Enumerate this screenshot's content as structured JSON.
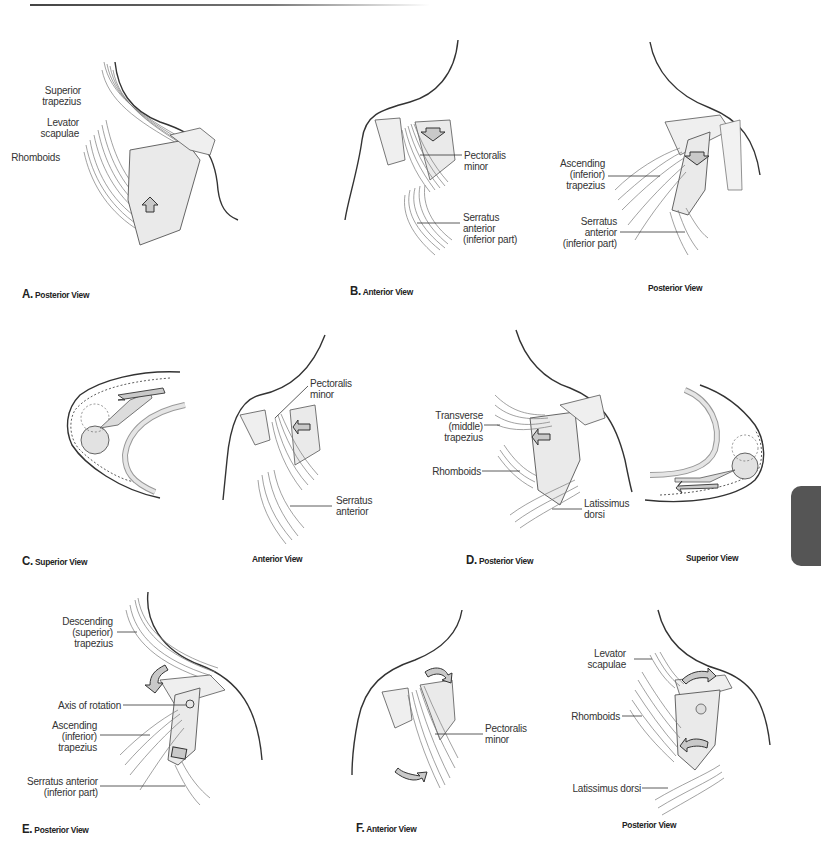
{
  "page": {
    "type": "anatomical-figure",
    "colors": {
      "line": "#333333",
      "muscle": "#8a8a8a",
      "bone_fill": "#e6e6e6",
      "arrow_fill": "#c9c9c9",
      "tab": "#555555"
    }
  },
  "panels": [
    {
      "id": "A",
      "caption_letter": "A.",
      "caption": "Posterior View",
      "labels": [
        "Superior trapezius",
        "Levator scapulae",
        "Rhomboids"
      ],
      "label_lines": {
        "superior_trapezius": [
          "Superior",
          "trapezius"
        ],
        "levator_scapulae": [
          "Levator",
          "scapulae"
        ],
        "rhomboids": [
          "Rhomboids"
        ]
      },
      "arrow": "up"
    },
    {
      "id": "B",
      "caption_letter": "B.",
      "caption": "Anterior View",
      "labels": [
        "Pectoralis minor",
        "Serratus anterior (inferior part)"
      ],
      "label_lines": {
        "pectoralis_minor": [
          "Pectoralis minor"
        ],
        "serratus": [
          "Serratus anterior",
          "(inferior part)"
        ]
      },
      "arrow": "down"
    },
    {
      "id": "B2",
      "caption_letter": "",
      "caption": "Posterior View",
      "labels": [
        "Ascending (inferior) trapezius",
        "Serratus anterior (inferior part)"
      ],
      "label_lines": {
        "ascending": [
          "Ascending",
          "(inferior)",
          "trapezius"
        ],
        "serratus": [
          "Serratus",
          "anterior",
          "(inferior part)"
        ]
      },
      "arrow": "down"
    },
    {
      "id": "C",
      "caption_letter": "C.",
      "caption": "Superior View",
      "labels": [],
      "arrow": "curved-left"
    },
    {
      "id": "C2",
      "caption_letter": "",
      "caption": "Anterior View",
      "labels": [
        "Pectoralis minor",
        "Serratus anterior"
      ],
      "label_lines": {
        "pectoralis_minor": [
          "Pectoralis",
          "minor"
        ],
        "serratus": [
          "Serratus",
          "anterior"
        ]
      },
      "arrow": "left"
    },
    {
      "id": "D",
      "caption_letter": "D.",
      "caption": "Posterior View",
      "labels": [
        "Transverse (middle) trapezius",
        "Rhomboids",
        "Latissimus dorsi"
      ],
      "label_lines": {
        "transverse": [
          "Transverse",
          "(middle)",
          "trapezius"
        ],
        "rhomboids": [
          "Rhomboids"
        ],
        "latissimus": [
          "Latissimus",
          "dorsi"
        ]
      },
      "arrow": "left"
    },
    {
      "id": "D2",
      "caption_letter": "",
      "caption": "Superior View",
      "labels": [],
      "arrow": "left"
    },
    {
      "id": "E",
      "caption_letter": "E.",
      "caption": "Posterior View",
      "labels": [
        "Descending (superior) trapezius",
        "Axis of rotation",
        "Ascending (inferior) trapezius",
        "Serratus anterior (inferior part)"
      ],
      "label_lines": {
        "descending": [
          "Descending",
          "(superior)",
          "trapezius"
        ],
        "axis": [
          "Axis of rotation"
        ],
        "ascending": [
          "Ascending",
          "(inferior)",
          "trapezius"
        ],
        "serratus": [
          "Serratus anterior",
          "(inferior part)"
        ]
      },
      "arrow": "rotation"
    },
    {
      "id": "F",
      "caption_letter": "F.",
      "caption": "Anterior View",
      "labels": [
        "Pectoralis minor"
      ],
      "label_lines": {
        "pectoralis_minor": [
          "Pectoralis",
          "minor"
        ]
      },
      "arrow": "rotation"
    },
    {
      "id": "F2",
      "caption_letter": "",
      "caption": "Posterior View",
      "labels": [
        "Levator scapulae",
        "Rhomboids",
        "Latissimus dorsi"
      ],
      "label_lines": {
        "levator": [
          "Levator",
          "scapulae"
        ],
        "rhomboids": [
          "Rhomboids"
        ],
        "latissimus": [
          "Latissimus dorsi"
        ]
      },
      "arrow": "rotation"
    }
  ]
}
